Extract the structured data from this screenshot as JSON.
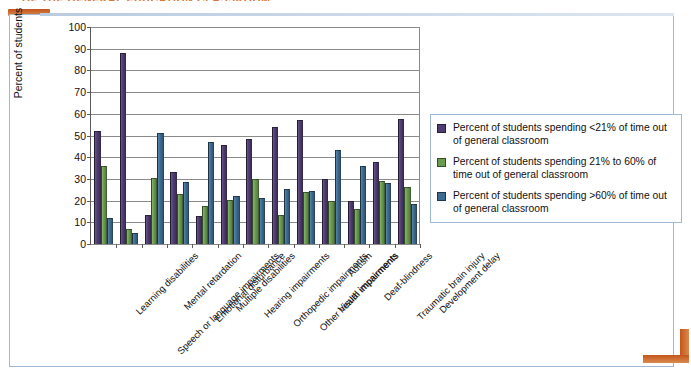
{
  "page": {
    "header_cut_text": "OF THE GENERAL EDUCATION CLASSROOM",
    "frame_color": "#9FB8D4",
    "accent_color": "#C4551B"
  },
  "chart_data": {
    "type": "bar",
    "title": "",
    "xlabel": "",
    "ylabel": "Percent of students",
    "ylim": [
      0,
      100
    ],
    "ytick_labels": [
      "0",
      "10",
      "20",
      "30",
      "40",
      "50",
      "60",
      "70",
      "80",
      "90",
      "100"
    ],
    "grid": true,
    "legend_position": "right",
    "colors": {
      "series0": "#4F3D72",
      "series1": "#6B9B50",
      "series2": "#3E6B90"
    },
    "categories": [
      "Learning disabilities",
      "Speech or language impairments",
      "Mental retardation",
      "Emotional disturbance",
      "Multiple disabilities",
      "Hearing impairments",
      "Orthopedic impairments",
      "Other health impairments",
      "Visual impairments",
      "Autism",
      "Deaf-blindness",
      "Traumatic brain injury",
      "Development delay"
    ],
    "series": [
      {
        "name": "Percent of students spending <21% of time out of general classroom",
        "color": "#4F3D72",
        "values": [
          52,
          88,
          13.5,
          33,
          13,
          45.5,
          48.5,
          54,
          57,
          30,
          20,
          38,
          57.5
        ]
      },
      {
        "name": "Percent of students spending 21% to 60% of time out of general classroom",
        "color": "#6B9B50",
        "values": [
          36,
          7,
          30.5,
          23,
          17.5,
          20.5,
          30,
          13.5,
          24,
          20,
          16,
          29,
          26.5
        ]
      },
      {
        "name": "Percent of students spending >60% of time out of general classroom",
        "color": "#3E6B90",
        "values": [
          12,
          5,
          51,
          28.5,
          47,
          22,
          21,
          25.5,
          24.5,
          43.5,
          36,
          28,
          18.5
        ]
      }
    ]
  },
  "legend": {
    "entries": [
      "Percent of students spending <21% of time out of general classroom",
      "Percent of students spending 21% to 60% of time out of general classroom",
      "Percent of students spending >60% of time out of general classroom"
    ]
  }
}
